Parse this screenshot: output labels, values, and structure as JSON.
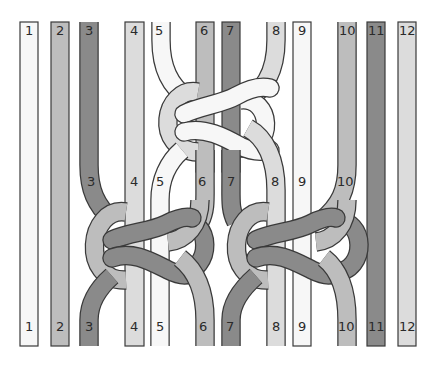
{
  "diagram": {
    "title": "",
    "type": "macrame-knot-diagram",
    "colors": {
      "white": "#f7f7f7",
      "light": "#dcdcdc",
      "mid": "#bdbdbd",
      "dark": "#8a8a8a",
      "outline": "#3a3a3a",
      "background": "#ffffff"
    },
    "cords": [
      {
        "id": 1,
        "label": "1",
        "shade": "white"
      },
      {
        "id": 2,
        "label": "2",
        "shade": "mid"
      },
      {
        "id": 3,
        "label": "3",
        "shade": "dark"
      },
      {
        "id": 4,
        "label": "4",
        "shade": "light"
      },
      {
        "id": 5,
        "label": "5",
        "shade": "white"
      },
      {
        "id": 6,
        "label": "6",
        "shade": "mid"
      },
      {
        "id": 7,
        "label": "7",
        "shade": "dark"
      },
      {
        "id": 8,
        "label": "8",
        "shade": "light"
      },
      {
        "id": 9,
        "label": "9",
        "shade": "white"
      },
      {
        "id": 10,
        "label": "10",
        "shade": "mid"
      },
      {
        "id": 11,
        "label": "11",
        "shade": "dark"
      },
      {
        "id": 12,
        "label": "12",
        "shade": "light"
      }
    ],
    "top_labels": [
      "1",
      "2",
      "3",
      "4",
      "5",
      "6",
      "7",
      "8",
      "9",
      "10",
      "11",
      "12"
    ],
    "middle_labels": [
      "3",
      "4",
      "5",
      "6",
      "7",
      "8",
      "9",
      "10"
    ],
    "bottom_labels": [
      "1",
      "2",
      "3",
      "4",
      "5",
      "6",
      "7",
      "8",
      "9",
      "10",
      "11",
      "12"
    ],
    "knots": [
      {
        "name": "top-knot",
        "cords": [
          5,
          6,
          7,
          8
        ]
      },
      {
        "name": "lower-left-knot",
        "cords": [
          3,
          4,
          5,
          6
        ]
      },
      {
        "name": "lower-right-knot",
        "cords": [
          7,
          8,
          9,
          10
        ]
      }
    ]
  }
}
